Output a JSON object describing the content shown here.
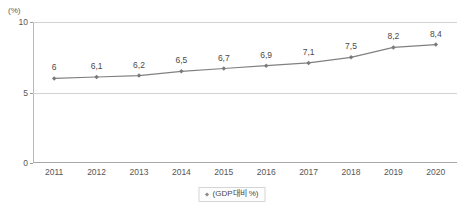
{
  "chart_data": {
    "type": "line",
    "title": "",
    "xlabel": "",
    "ylabel": "",
    "yunit": "(%)",
    "categories": [
      "2011",
      "2012",
      "2013",
      "2014",
      "2015",
      "2016",
      "2017",
      "2018",
      "2019",
      "2020"
    ],
    "values": [
      6,
      6.1,
      6.2,
      6.5,
      6.7,
      6.9,
      7.1,
      7.5,
      8.2,
      8.4
    ],
    "point_labels": [
      "6",
      "6,1",
      "6,2",
      "6,5",
      "6,7",
      "6,9",
      "7,1",
      "7,5",
      "8,2",
      "8,4"
    ],
    "ylim": [
      0,
      10
    ],
    "yticks": [
      0,
      5,
      10
    ],
    "ytick_labels": [
      "0",
      "5",
      "10"
    ],
    "gridlines": [
      5,
      10
    ],
    "grid": true,
    "legend": {
      "position": "bottom-center",
      "entries": [
        {
          "label": "(GDP대비 %)",
          "marker": "diamond-marker"
        }
      ]
    },
    "series": [
      {
        "name": "(GDP대비 %)",
        "values": [
          6,
          6.1,
          6.2,
          6.5,
          6.7,
          6.9,
          7.1,
          7.5,
          8.2,
          8.4
        ],
        "line_color": "#808080",
        "marker_color": "#7a7a7a"
      }
    ],
    "colors": {
      "line": "#808080",
      "marker": "#7a7a7a",
      "grid": "#d2d2d2",
      "axis": "#a8a8a8",
      "text": "#565656",
      "background": "#ffffff"
    }
  }
}
